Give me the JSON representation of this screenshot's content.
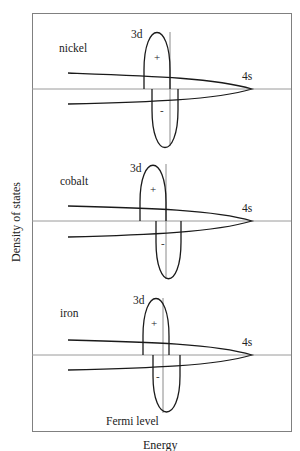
{
  "diagram": {
    "title": "",
    "x_axis_label": "Energy",
    "y_axis_label": "Density of states",
    "fermi_label": "Fermi level",
    "colors": {
      "frame": "#808080",
      "baseline": "#9a9a9a",
      "curve": "#1a1a1a",
      "fermi_line": "#8a8a8a",
      "text": "#222222"
    },
    "panels": [
      {
        "metal": "nickel",
        "band_3d_label": "3d",
        "band_4s_label": "4s",
        "spin_up_sign": "+",
        "spin_down_sign": "-"
      },
      {
        "metal": "cobalt",
        "band_3d_label": "3d",
        "band_4s_label": "4s",
        "spin_up_sign": "+",
        "spin_down_sign": "-"
      },
      {
        "metal": "iron",
        "band_3d_label": "3d",
        "band_4s_label": "4s",
        "spin_up_sign": "+",
        "spin_down_sign": "-"
      }
    ]
  }
}
